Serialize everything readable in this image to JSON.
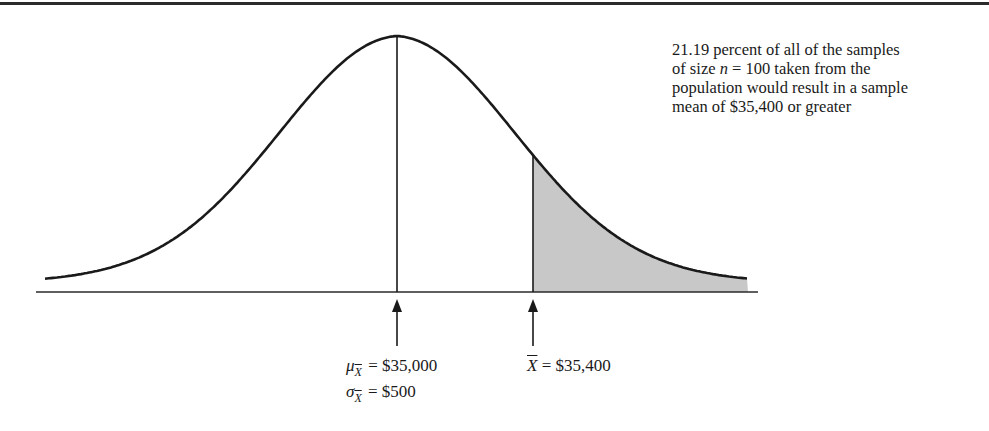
{
  "annotation": {
    "line1": "21.19 percent of all of the samples",
    "line2_pre": "of size ",
    "line2_var": "n",
    "line2_post": " = 100 taken from the",
    "line3": "population would result in a sample",
    "line4": "mean of $35,400 or greater"
  },
  "labels": {
    "mean_symbol": "μ",
    "sd_symbol": "σ",
    "subscript": "X",
    "mean_value": " = $35,000",
    "sd_value": " = $500",
    "xbar_symbol": "X",
    "xbar_value": " = $35,400"
  },
  "colors": {
    "line": "#1a1a1a",
    "shade": "#c8c8c8",
    "background": "#ffffff"
  },
  "chart_data": {
    "type": "area",
    "title": "",
    "distribution": "normal",
    "mean": 35000,
    "standard_error": 500,
    "sample_size": 100,
    "shaded_region": {
      "from": 35400,
      "to": "right tail",
      "probability_percent": 21.19
    },
    "markers": [
      {
        "label": "μX̄ = $35,000",
        "value": 35000
      },
      {
        "label": "X̄ = $35,400",
        "value": 35400
      }
    ],
    "annotation": "21.19 percent of all of the samples of size n = 100 taken from the population would result in a sample mean of $35,400 or greater",
    "xlabel": "",
    "ylabel": "",
    "grid": false,
    "legend": false
  }
}
